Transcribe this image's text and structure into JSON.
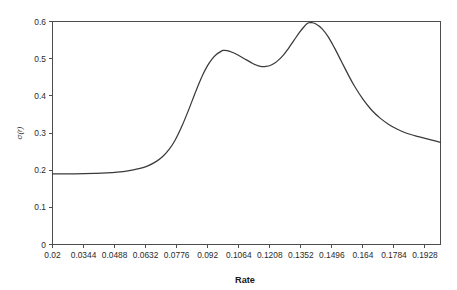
{
  "chart_data": {
    "type": "line",
    "title": "",
    "xlabel": "Rate",
    "ylabel": "σ(r)",
    "xlim": [
      0.02,
      0.2
    ],
    "ylim": [
      0,
      0.6
    ],
    "grid": false,
    "legend": null,
    "x_tick_labels": [
      "0.02",
      "0.0344",
      "0.0488",
      "0.0632",
      "0.0776",
      "0.092",
      "0.1064",
      "0.1208",
      "0.1352",
      "0.1496",
      "0.164",
      "0.1784",
      "0.1928"
    ],
    "x_tick_values": [
      0.02,
      0.0344,
      0.0488,
      0.0632,
      0.0776,
      0.092,
      0.1064,
      0.1208,
      0.1352,
      0.1496,
      0.164,
      0.1784,
      0.1928
    ],
    "y_tick_labels": [
      "0",
      "0.1",
      "0.2",
      "0.3",
      "0.4",
      "0.5",
      "0.6"
    ],
    "y_tick_values": [
      0,
      0.1,
      0.2,
      0.3,
      0.4,
      0.5,
      0.6
    ],
    "series": [
      {
        "name": "sigma(r)",
        "color": "#3a3a3a",
        "x": [
          0.02,
          0.025,
          0.03,
          0.035,
          0.04,
          0.045,
          0.05,
          0.055,
          0.06,
          0.064,
          0.068,
          0.071,
          0.074,
          0.077,
          0.08,
          0.083,
          0.086,
          0.088,
          0.09,
          0.092,
          0.094,
          0.096,
          0.098,
          0.0992,
          0.101,
          0.103,
          0.106,
          0.109,
          0.112,
          0.114,
          0.1165,
          0.119,
          0.1215,
          0.124,
          0.127,
          0.1295,
          0.132,
          0.1345,
          0.137,
          0.1385,
          0.14,
          0.142,
          0.145,
          0.148,
          0.151,
          0.154,
          0.157,
          0.16,
          0.164,
          0.168,
          0.172,
          0.176,
          0.18,
          0.184,
          0.188,
          0.192,
          0.196,
          0.2
        ],
        "y": [
          0.19,
          0.19,
          0.1902,
          0.1906,
          0.1913,
          0.1925,
          0.1945,
          0.198,
          0.204,
          0.211,
          0.223,
          0.236,
          0.255,
          0.282,
          0.318,
          0.36,
          0.405,
          0.434,
          0.46,
          0.482,
          0.499,
          0.511,
          0.519,
          0.522,
          0.5215,
          0.518,
          0.51,
          0.5,
          0.49,
          0.484,
          0.479,
          0.479,
          0.483,
          0.492,
          0.509,
          0.528,
          0.549,
          0.57,
          0.588,
          0.596,
          0.597,
          0.594,
          0.581,
          0.558,
          0.527,
          0.493,
          0.459,
          0.427,
          0.391,
          0.362,
          0.34,
          0.323,
          0.31,
          0.3,
          0.293,
          0.287,
          0.281,
          0.275
        ]
      }
    ]
  }
}
